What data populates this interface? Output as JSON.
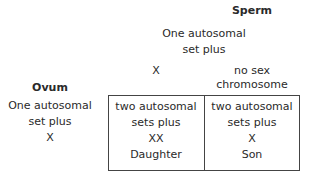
{
  "sperm": {
    "heading": "Sperm",
    "description_line1": "One autosomal",
    "description_line2": "set plus",
    "options": [
      {
        "line1": "X",
        "line2": ""
      },
      {
        "line1": "no sex",
        "line2": "chromosome"
      }
    ]
  },
  "ovum": {
    "heading": "Ovum",
    "description_line1": "One autosomal",
    "description_line2": "set plus",
    "chromosome": "X"
  },
  "grid": {
    "cells": [
      {
        "line1": "two autosomal",
        "line2": "sets plus",
        "chromosomes": "XX",
        "offspring": "Daughter"
      },
      {
        "line1": "two autosomal",
        "line2": "sets plus",
        "chromosomes": "X",
        "offspring": "Son"
      }
    ]
  }
}
